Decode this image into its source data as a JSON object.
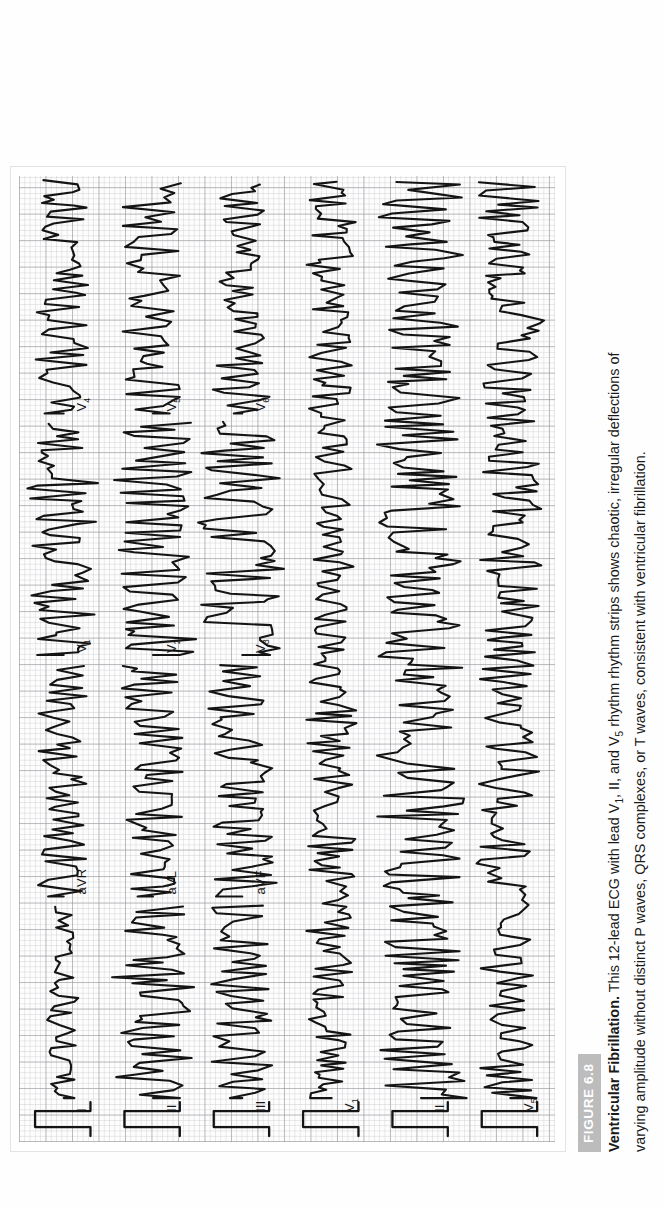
{
  "figure": {
    "badge_label": "FIGURE 6.8",
    "badge_color": "#bcbcbc",
    "caption_title": "Ventricular Fibrillation.",
    "caption_line1_a": " This 12-lead ECG with lead V",
    "caption_line1_sub1": "1",
    "caption_line1_b": ", II, and V",
    "caption_line1_sub2": "5",
    "caption_line1_c": " rhythm rhythm strips shows chaotic, irregular deflections of",
    "caption_line2": "varying amplitude without distinct P waves, QRS complexes, or T waves, consistent with ventricular fibrillation.",
    "caption_full": "Ventricular Fibrillation. This 12-lead ECG with lead V1, II, and V5 rhythm rhythm strips shows chaotic, irregular deflections of varying amplitude without distinct P waves, QRS complexes, or T waves, consistent with ventricular fibrillation."
  },
  "ecg": {
    "paper_background": "#fdfdfd",
    "grid_minor_color": "#c3c3c8",
    "grid_major_color": "#96969b",
    "trace_color": "#141414",
    "rows": 6,
    "columns": 4,
    "calibration_pulse": true,
    "leads": [
      {
        "label": "I",
        "sub": "",
        "row": 0,
        "col": 0
      },
      {
        "label": "aVR",
        "sub": "",
        "row": 0,
        "col": 1
      },
      {
        "label": "V",
        "sub": "1",
        "row": 0,
        "col": 2
      },
      {
        "label": "V",
        "sub": "4",
        "row": 0,
        "col": 3
      },
      {
        "label": "II",
        "sub": "",
        "row": 1,
        "col": 0
      },
      {
        "label": "aVL",
        "sub": "",
        "row": 1,
        "col": 1
      },
      {
        "label": "V",
        "sub": "2",
        "row": 1,
        "col": 2
      },
      {
        "label": "V",
        "sub": "5",
        "row": 1,
        "col": 3
      },
      {
        "label": "III",
        "sub": "",
        "row": 2,
        "col": 0
      },
      {
        "label": "aVF",
        "sub": "",
        "row": 2,
        "col": 1
      },
      {
        "label": "V",
        "sub": "3",
        "row": 2,
        "col": 2
      },
      {
        "label": "V",
        "sub": "6",
        "row": 2,
        "col": 3
      }
    ],
    "rhythm_strips": [
      {
        "label": "V",
        "sub": "1",
        "row": 3
      },
      {
        "label": "II",
        "sub": "",
        "row": 4
      },
      {
        "label": "V",
        "sub": "5",
        "row": 5
      }
    ]
  },
  "chart_data": {
    "type": "line",
    "xlabel": "Time",
    "ylabel": "Amplitude (mV)",
    "grid": true,
    "legend_position": "inline-labels",
    "paper_speed_mm_per_s": 25,
    "calibration_mm_per_mV": 10,
    "series": [
      {
        "name": "I",
        "row": 0,
        "col": 0,
        "amplitude_mm": 4,
        "morphology": "low-amplitude coarse fibrillatory waves"
      },
      {
        "name": "aVR",
        "row": 0,
        "col": 1,
        "amplitude_mm": 6,
        "morphology": "irregular fibrillatory waves"
      },
      {
        "name": "V1",
        "row": 0,
        "col": 2,
        "amplitude_mm": 9,
        "morphology": "coarse fibrillatory waves"
      },
      {
        "name": "V4",
        "row": 0,
        "col": 3,
        "amplitude_mm": 7,
        "morphology": "coarse fibrillatory waves"
      },
      {
        "name": "II",
        "row": 1,
        "col": 0,
        "amplitude_mm": 10,
        "morphology": "coarse fibrillatory waves"
      },
      {
        "name": "aVL",
        "row": 1,
        "col": 1,
        "amplitude_mm": 8,
        "morphology": "irregular fibrillatory waves"
      },
      {
        "name": "V2",
        "row": 1,
        "col": 2,
        "amplitude_mm": 11,
        "morphology": "coarse fibrillatory waves"
      },
      {
        "name": "V5",
        "row": 1,
        "col": 3,
        "amplitude_mm": 8,
        "morphology": "coarse fibrillatory waves"
      },
      {
        "name": "III",
        "row": 2,
        "col": 0,
        "amplitude_mm": 9,
        "morphology": "coarse fibrillatory waves"
      },
      {
        "name": "aVF",
        "row": 2,
        "col": 1,
        "amplitude_mm": 9,
        "morphology": "coarse fibrillatory waves"
      },
      {
        "name": "V3",
        "row": 2,
        "col": 2,
        "amplitude_mm": 12,
        "morphology": "coarse fibrillatory waves"
      },
      {
        "name": "V6",
        "row": 2,
        "col": 3,
        "amplitude_mm": 7,
        "morphology": "coarse fibrillatory waves"
      },
      {
        "name": "V1 rhythm",
        "row": 3,
        "amplitude_mm": 6,
        "morphology": "continuous fibrillatory rhythm strip"
      },
      {
        "name": "II rhythm",
        "row": 4,
        "amplitude_mm": 11,
        "morphology": "continuous fibrillatory rhythm strip"
      },
      {
        "name": "V5 rhythm",
        "row": 5,
        "amplitude_mm": 8,
        "morphology": "continuous fibrillatory rhythm strip"
      }
    ],
    "annotations": [
      "No discernible P waves",
      "No discernible QRS complexes",
      "No discernible T waves",
      "Chaotic irregular deflections of varying amplitude"
    ]
  }
}
